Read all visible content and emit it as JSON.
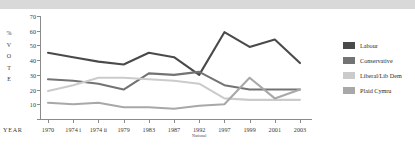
{
  "chart_data": {
    "type": "line",
    "title": "",
    "xlabel": "YEAR",
    "ylabel": "% VOTE",
    "ylabel_chars": [
      "%",
      "V",
      "O",
      "T",
      "E"
    ],
    "ylim": [
      0,
      70
    ],
    "yticks": [
      0,
      10,
      20,
      30,
      40,
      50,
      60,
      70
    ],
    "ytick_labels": [
      "",
      "10",
      "20",
      "30",
      "40",
      "50",
      "60",
      "70"
    ],
    "grid": false,
    "legend_position": "right",
    "categories": [
      "1970",
      "1974 i",
      "1974 ii",
      "1979",
      "1983",
      "1987",
      "1992",
      "1997",
      "1999",
      "2001",
      "2003"
    ],
    "category_sublabels": [
      "",
      "",
      "",
      "",
      "",
      "",
      "National",
      "",
      "",
      "",
      ""
    ],
    "series": [
      {
        "name": "Labour",
        "color": "#4a4a4a",
        "values": [
          45,
          42,
          39,
          37,
          45,
          42,
          30,
          59,
          49,
          54,
          38
        ]
      },
      {
        "name": "Conservative",
        "color": "#737373",
        "values": [
          27,
          26,
          24,
          20,
          31,
          30,
          32,
          23,
          20,
          20,
          20
        ]
      },
      {
        "name": "Liberal/Lib Dem",
        "color": "#cbcbcb",
        "values": [
          19,
          23,
          28,
          28,
          27,
          26,
          24,
          14,
          13,
          13,
          13
        ]
      },
      {
        "name": "Plaid Cymru",
        "color": "#a8a8a8",
        "values": [
          11,
          10,
          11,
          8,
          8,
          7,
          9,
          10,
          28,
          14,
          20
        ]
      }
    ]
  },
  "legend": {
    "items": [
      {
        "label": "Labour",
        "color": "#4a4a4a"
      },
      {
        "label": "Conservative",
        "color": "#737373"
      },
      {
        "label": "Liberal/Lib Dem",
        "color": "#cbcbcb"
      },
      {
        "label": "Plaid Cymru",
        "color": "#a8a8a8"
      }
    ]
  }
}
